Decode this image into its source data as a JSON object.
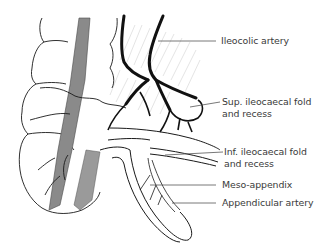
{
  "figure": {
    "colors": {
      "background": "#ffffff",
      "ink": "#1a1a1a",
      "label_text": "#3a3a3a",
      "leader_line": "#555555",
      "shaded_band": "#8a8a8a"
    },
    "labels": [
      {
        "id": "ileocolic-artery",
        "lines": [
          "Ileocolic artery"
        ]
      },
      {
        "id": "sup-ileocaecal-fold",
        "lines": [
          "Sup. ileocaecal fold",
          "and recess"
        ]
      },
      {
        "id": "inf-ileocaecal-fold",
        "lines": [
          "Inf. ileocaecal fold",
          "and recess"
        ]
      },
      {
        "id": "meso-appendix",
        "lines": [
          "Meso-appendix"
        ]
      },
      {
        "id": "appendicular-artery",
        "lines": [
          "Appendicular artery"
        ]
      }
    ]
  }
}
